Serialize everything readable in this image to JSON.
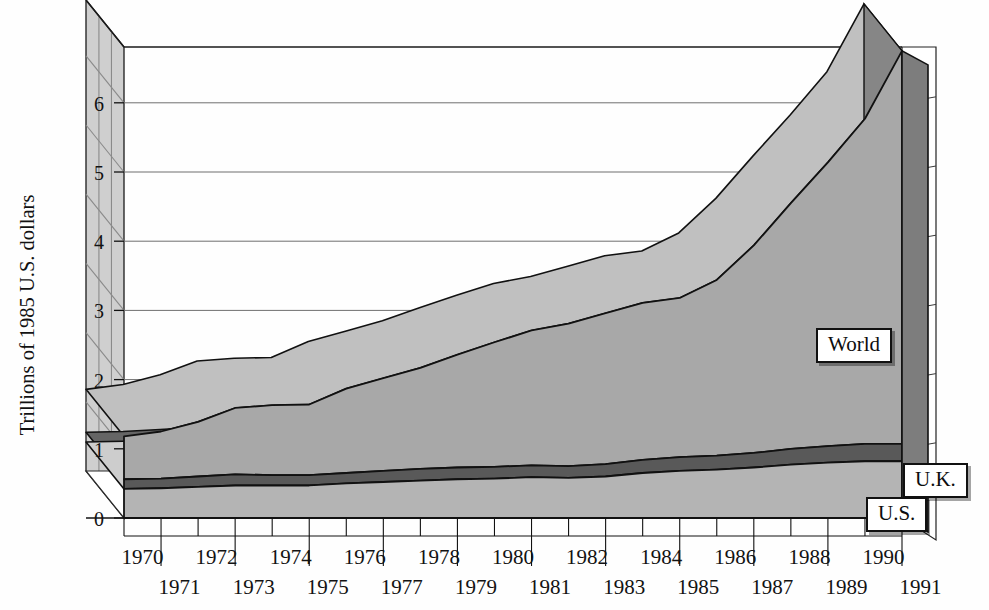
{
  "chart_data": {
    "type": "area",
    "title": "",
    "subtitle": "",
    "xlabel": "",
    "ylabel": "Trillions of 1985 U.S. dollars",
    "stacked": true,
    "three_d": true,
    "grid": true,
    "legend_position": "inline-labels",
    "ylim": [
      0,
      7
    ],
    "yticks": [
      0,
      1,
      2,
      3,
      4,
      5,
      6
    ],
    "ytick_labels": [
      "0",
      "1",
      "2",
      "3",
      "4",
      "5",
      "6"
    ],
    "x": [
      1970,
      1971,
      1972,
      1973,
      1974,
      1975,
      1976,
      1977,
      1978,
      1979,
      1980,
      1981,
      1982,
      1983,
      1984,
      1985,
      1986,
      1987,
      1988,
      1989,
      1990,
      1991
    ],
    "xtick_labels_upper": [
      "1970",
      "1972",
      "1974",
      "1976",
      "1978",
      "1980",
      "1982",
      "1984",
      "1986",
      "1988",
      "1990"
    ],
    "xtick_labels_lower": [
      "1971",
      "1973",
      "1975",
      "1977",
      "1979",
      "1981",
      "1983",
      "1985",
      "1987",
      "1989",
      "1991"
    ],
    "series": [
      {
        "name": "U.S.",
        "label": "U.S.",
        "color": "#b4b4b4",
        "values": [
          0.42,
          0.43,
          0.45,
          0.47,
          0.47,
          0.47,
          0.5,
          0.52,
          0.54,
          0.56,
          0.57,
          0.59,
          0.58,
          0.6,
          0.65,
          0.68,
          0.7,
          0.73,
          0.77,
          0.8,
          0.82,
          0.82
        ]
      },
      {
        "name": "U.K.",
        "label": "U.K.",
        "color": "#595959",
        "values": [
          0.14,
          0.14,
          0.15,
          0.16,
          0.15,
          0.15,
          0.15,
          0.16,
          0.17,
          0.17,
          0.17,
          0.17,
          0.17,
          0.18,
          0.19,
          0.2,
          0.2,
          0.21,
          0.23,
          0.24,
          0.25,
          0.25
        ]
      },
      {
        "name": "World",
        "label": "World",
        "color": "#a8a8a8",
        "values": [
          0.62,
          0.68,
          0.79,
          0.96,
          1.01,
          1.02,
          1.22,
          1.34,
          1.46,
          1.63,
          1.8,
          1.95,
          2.06,
          2.18,
          2.27,
          2.3,
          2.54,
          3.0,
          3.55,
          4.1,
          4.7,
          5.68
        ]
      }
    ],
    "totals": [
      1.18,
      1.25,
      1.39,
      1.59,
      1.63,
      1.64,
      1.87,
      2.02,
      2.17,
      2.36,
      2.54,
      2.71,
      2.81,
      2.96,
      3.11,
      3.18,
      3.44,
      3.94,
      4.55,
      5.14,
      5.77,
      6.75
    ],
    "annotations": [
      {
        "text": "World",
        "x": 1989.0,
        "y": 3.0
      },
      {
        "text": "U.K.",
        "x": 1991.3,
        "y": 1.05
      },
      {
        "text": "U.S.",
        "x": 1990.2,
        "y": 0.55
      }
    ]
  },
  "axis": {
    "y_title": "Trillions of 1985 U.S. dollars",
    "y_ticks": [
      "6",
      "5",
      "4",
      "3",
      "2",
      "1",
      "0"
    ],
    "x_upper": [
      "1970",
      "1972",
      "1974",
      "1976",
      "1978",
      "1980",
      "1982",
      "1984",
      "1986",
      "1988",
      "1990"
    ],
    "x_lower": [
      "1971",
      "1973",
      "1975",
      "1977",
      "1979",
      "1981",
      "1983",
      "1985",
      "1987",
      "1989",
      "1991"
    ]
  },
  "keys": {
    "world": "World",
    "uk": "U.K.",
    "us": "U.S."
  },
  "colors": {
    "world_fill": "#a8a8a8",
    "world_top": "#bdbdbd",
    "world_side": "#8e8e8e",
    "uk_fill": "#595959",
    "uk_top": "#6e6e6e",
    "uk_side": "#4a4a4a",
    "us_fill": "#b4b4b4",
    "us_top": "#d2d2d2",
    "us_side": "#9a9a9a",
    "wall": "#cfcfcf",
    "wall_line": "#8a8a8a",
    "outline": "#111111",
    "grid": "#9a9a9a",
    "background": "#ffffff"
  }
}
